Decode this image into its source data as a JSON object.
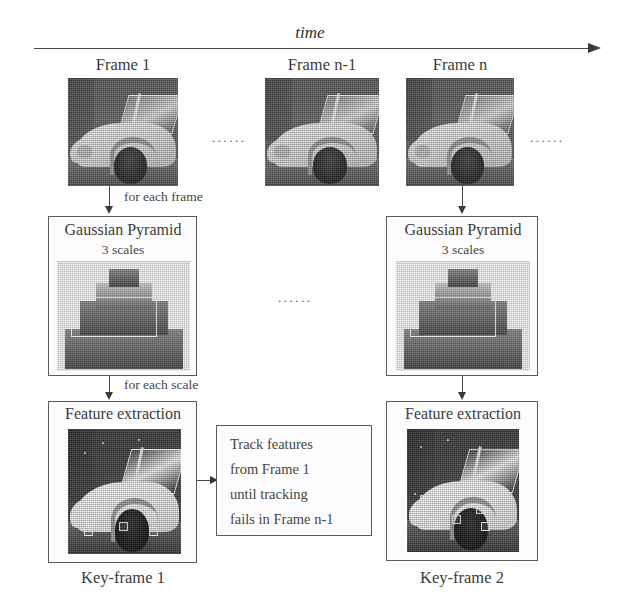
{
  "figure": {
    "type": "pipeline-diagram",
    "background": "#ffffff",
    "ink": "#3a3a3a"
  },
  "timeline": {
    "label": "time",
    "direction": "left-to-right",
    "arrowhead": "right"
  },
  "frames": [
    {
      "label": "Frame 1",
      "image_alt": "grayscale photo of a light coloured car, side front view"
    },
    {
      "label": "Frame n-1",
      "image_alt": "grayscale photo of a light coloured car, side front view"
    },
    {
      "label": "Frame n",
      "image_alt": "grayscale photo of a light coloured car, side front view"
    }
  ],
  "ellipses": {
    "after_frame1": "......",
    "middle_row": "......",
    "after_frame_n": "......"
  },
  "edges": {
    "for_each_frame": "for each frame",
    "for_each_scale": "for each scale"
  },
  "pyramid": {
    "title": "Gaussian Pyramid",
    "subtitle": "3 scales",
    "image_alt": "three stacked image planes forming a pyramid"
  },
  "feature": {
    "title": "Feature extraction",
    "image_alt": "high contrast car image with small square feature markers"
  },
  "keyframes": [
    {
      "label": "Key-frame 1"
    },
    {
      "label": "Key-frame 2"
    }
  ],
  "tracking_note": {
    "lines": [
      "Track features",
      "from Frame 1",
      "until tracking",
      "fails in Frame n-1"
    ]
  }
}
